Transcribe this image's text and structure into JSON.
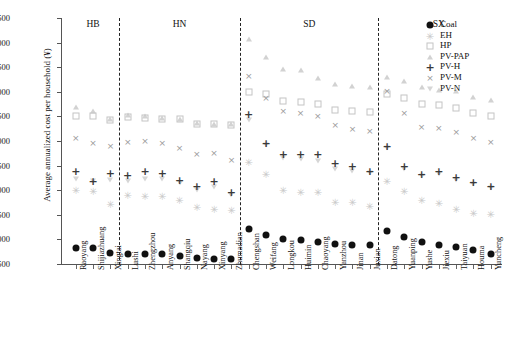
{
  "chart_data": {
    "type": "scatter",
    "title": "",
    "xlabel": "",
    "ylabel": "Average annualized cost per household (¥)",
    "ylim": [
      500,
      5500
    ],
    "ytick_values": [
      500,
      1000,
      1500,
      2000,
      2500,
      3000,
      3500,
      4000,
      4500,
      5000,
      5500
    ],
    "ytick_labels": [
      "500",
      "1000",
      "1500",
      "2000",
      "2500",
      "3000",
      "3500",
      "4000",
      "4500",
      "5000",
      "5500"
    ],
    "grid": false,
    "legend_position": "top-right",
    "groups": [
      {
        "name": "HB",
        "cities": [
          "Raoyang",
          "Shijiazhuang",
          "Xingtai"
        ]
      },
      {
        "name": "HN",
        "cities": [
          "Lushi",
          "Zhengzhou",
          "Anyang",
          "Shangqiu",
          "Nayang",
          "Xinyang",
          "Zhumadian"
        ]
      },
      {
        "name": "SD",
        "cities": [
          "Chengshan",
          "Weifang",
          "Longkou",
          "Huimin",
          "Chaoyang",
          "Yanzhou",
          "Jinan",
          "Juxian"
        ]
      },
      {
        "name": "SX",
        "cities": [
          "Datong",
          "Yuanping",
          "Yushe",
          "Jiexiu",
          "Taiyuan",
          "Houma",
          "Yuncheng"
        ]
      }
    ],
    "categories": [
      "Raoyang",
      "Shijiazhuang",
      "Xingtai",
      "Lushi",
      "Zhengzhou",
      "Anyang",
      "Shangqiu",
      "Nayang",
      "Xinyang",
      "Zhumadian",
      "Chengshan",
      "Weifang",
      "Longkou",
      "Huimin",
      "Chaoyang",
      "Yanzhou",
      "Jinan",
      "Juxian",
      "Datong",
      "Yuanping",
      "Yushe",
      "Jiexiu",
      "Taiyuan",
      "Houma",
      "Yuncheng"
    ],
    "series": [
      {
        "name": "Coal",
        "marker": "filled-circle",
        "color": "#111111",
        "values": [
          820,
          820,
          730,
          700,
          700,
          695,
          670,
          625,
          605,
          600,
          1205,
          1080,
          1000,
          985,
          950,
          905,
          890,
          880,
          1180,
          1040,
          945,
          880,
          855,
          790,
          700
        ]
      },
      {
        "name": "EH",
        "marker": "asterisk",
        "color": "#c9c9c9",
        "values": [
          2010,
          1985,
          1725,
          1895,
          1880,
          1880,
          1800,
          1655,
          1610,
          1600,
          2570,
          2330,
          2000,
          1960,
          1955,
          1770,
          1760,
          1680,
          2180,
          1990,
          1810,
          1745,
          1620,
          1545,
          1510
        ]
      },
      {
        "name": "HP",
        "marker": "open-square",
        "color": "#c4c4c4",
        "values": [
          3500,
          3505,
          3420,
          3490,
          3475,
          3455,
          3440,
          3355,
          3340,
          3330,
          4000,
          3960,
          3820,
          3800,
          3745,
          3640,
          3605,
          3590,
          3960,
          3870,
          3760,
          3725,
          3680,
          3575,
          3510
        ]
      },
      {
        "name": "PV-PAP",
        "marker": "open-triangle-up",
        "color": "#d2d2d2",
        "values": [
          3690,
          3610,
          3440,
          3520,
          3500,
          3470,
          3450,
          3370,
          3350,
          3340,
          5070,
          4710,
          4455,
          4440,
          4280,
          4155,
          4120,
          4100,
          4300,
          4220,
          4090,
          4040,
          4010,
          3900,
          3840
        ]
      },
      {
        "name": "PV-H",
        "marker": "plus",
        "color": "#3a3a3a",
        "values": [
          2400,
          2180,
          2340,
          2305,
          2390,
          2340,
          2215,
          2095,
          2195,
          1965,
          3550,
          2965,
          2740,
          2735,
          2730,
          2560,
          2485,
          2385,
          2895,
          2495,
          2335,
          2390,
          2265,
          2170,
          2090
        ]
      },
      {
        "name": "PV-M",
        "marker": "x-cross",
        "color": "#9a9a9a",
        "values": [
          3070,
          2950,
          2890,
          2975,
          3000,
          2955,
          2860,
          2740,
          2765,
          2620,
          4330,
          3880,
          3600,
          3570,
          3505,
          3320,
          3245,
          3200,
          4010,
          3565,
          3290,
          3265,
          3180,
          3060,
          2980
        ]
      },
      {
        "name": "PV-N",
        "marker": "open-triangle-down",
        "color": "#d6d6d6",
        "values": [
          2225,
          2180,
          2215,
          2195,
          2230,
          2230,
          2150,
          2000,
          2060,
          1900,
          3430,
          2910,
          2650,
          2635,
          2600,
          2440,
          2400,
          2345,
          2850,
          2440,
          2290,
          2320,
          2215,
          2130,
          2050
        ]
      }
    ]
  },
  "legend": {
    "items": [
      {
        "label": "Coal",
        "symbol": "filled-circle"
      },
      {
        "label": "EH",
        "symbol": "asterisk"
      },
      {
        "label": "HP",
        "symbol": "open-square"
      },
      {
        "label": "PV-PAP",
        "symbol": "open-triangle-up"
      },
      {
        "label": "PV-H",
        "symbol": "plus"
      },
      {
        "label": "PV-M",
        "symbol": "x-cross"
      },
      {
        "label": "PV-N",
        "symbol": "open-triangle-down"
      }
    ]
  },
  "axes": {
    "y_title": "Average annualized cost per household (¥)"
  }
}
